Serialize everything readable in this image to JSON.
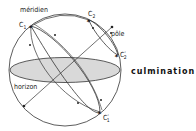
{
  "diagram": {
    "title": "culmination",
    "labels": {
      "meridian": "méridien",
      "pole": "pôle",
      "horizon": "horizon",
      "c1": "C",
      "c1_sub": "1",
      "c1p": "C",
      "c1p_sub": "1",
      "c1p_prime": "'",
      "c2": "C",
      "c2_sub": "2",
      "c2p": "C",
      "c2p_sub": "2",
      "c2p_prime": "'"
    },
    "colors": {
      "line": "#222222",
      "horizon_fill": "#d9d9d9",
      "background": "#ffffff"
    }
  }
}
